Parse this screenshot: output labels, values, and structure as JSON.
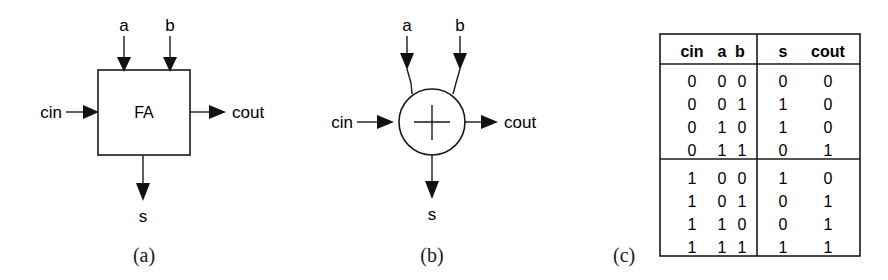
{
  "figure": {
    "background_color": "#ffffff",
    "line_color": "#1a1a1a",
    "panels": [
      {
        "id": "a",
        "caption": "(a)",
        "kind": "block-diagram",
        "block_label": "FA",
        "inputs_top": [
          "a",
          "b"
        ],
        "input_left": "cin",
        "output_right": "cout",
        "output_bottom": "s"
      },
      {
        "id": "b",
        "caption": "(b)",
        "kind": "circle-adder-symbol",
        "block_label": "+",
        "inputs_top": [
          "a",
          "b"
        ],
        "input_left": "cin",
        "output_right": "cout",
        "output_bottom": "s"
      },
      {
        "id": "c",
        "caption": "(c)",
        "kind": "truth-table"
      }
    ]
  },
  "panel_a": {
    "caption": "(a)",
    "block_label": "FA",
    "label_a": "a",
    "label_b": "b",
    "label_cin": "cin",
    "label_cout": "cout",
    "label_s": "s"
  },
  "panel_b": {
    "caption": "(b)",
    "block_label": "+",
    "label_a": "a",
    "label_b": "b",
    "label_cin": "cin",
    "label_cout": "cout",
    "label_s": "s"
  },
  "panel_c": {
    "caption": "(c)",
    "headers_input": [
      "cin",
      "a",
      "b"
    ],
    "headers_output": [
      "s",
      "cout"
    ],
    "header_cin": "cin",
    "header_a": "a",
    "header_b": "b",
    "header_s": "s",
    "header_cout": "cout",
    "rows": [
      {
        "cin": "0",
        "a": "0",
        "b": "0",
        "s": "0",
        "cout": "0"
      },
      {
        "cin": "0",
        "a": "0",
        "b": "1",
        "s": "1",
        "cout": "0"
      },
      {
        "cin": "0",
        "a": "1",
        "b": "0",
        "s": "1",
        "cout": "0"
      },
      {
        "cin": "0",
        "a": "1",
        "b": "1",
        "s": "0",
        "cout": "1"
      },
      {
        "cin": "1",
        "a": "0",
        "b": "0",
        "s": "1",
        "cout": "0"
      },
      {
        "cin": "1",
        "a": "0",
        "b": "1",
        "s": "0",
        "cout": "1"
      },
      {
        "cin": "1",
        "a": "1",
        "b": "0",
        "s": "0",
        "cout": "1"
      },
      {
        "cin": "1",
        "a": "1",
        "b": "1",
        "s": "1",
        "cout": "1"
      }
    ],
    "group_break_after_row": 4
  }
}
